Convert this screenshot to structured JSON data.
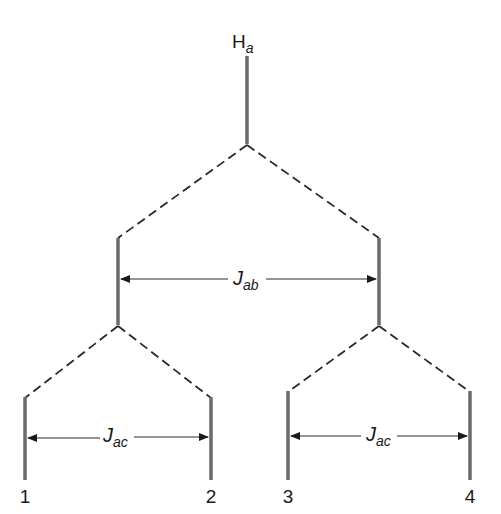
{
  "diagram": {
    "top_label": {
      "main": "H",
      "sub": "a"
    },
    "coupling_ab": {
      "main": "J",
      "sub": "ab"
    },
    "coupling_ac_left": {
      "main": "J",
      "sub": "ac"
    },
    "coupling_ac_right": {
      "main": "J",
      "sub": "ac"
    },
    "line_labels": [
      "1",
      "2",
      "3",
      "4"
    ],
    "colors": {
      "stem": "#6b6b6b",
      "dash": "#2a2a2a",
      "text": "#1a1a1a",
      "background": "#ffffff"
    }
  }
}
